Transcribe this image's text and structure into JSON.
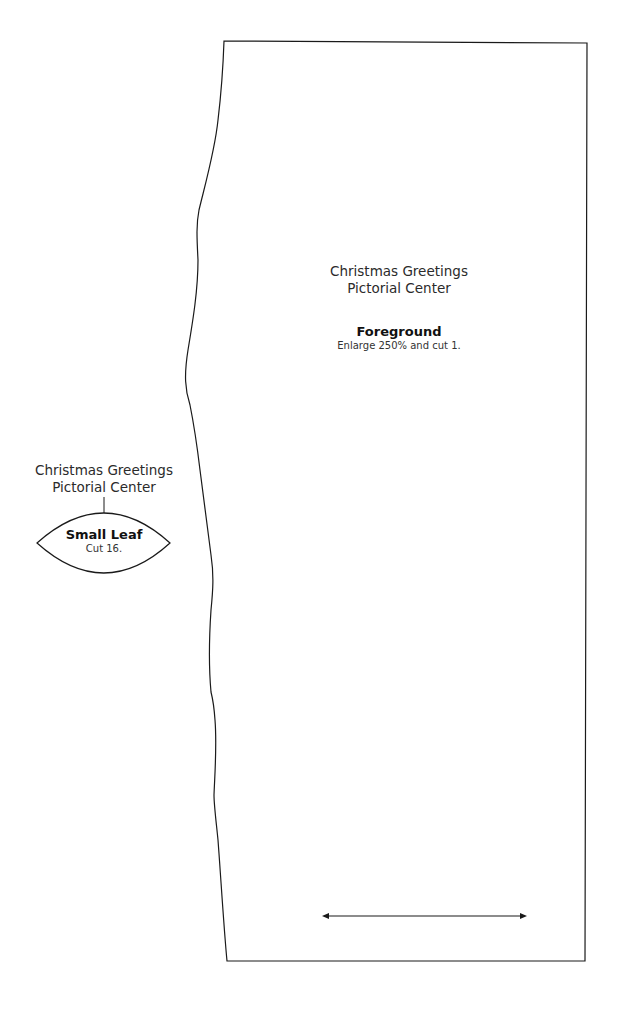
{
  "pattern": {
    "foreground": {
      "project_line1": "Christmas Greetings",
      "project_line2": "Pictorial Center",
      "piece_name": "Foreground",
      "instruction": "Enlarge 250% and cut 1."
    },
    "small_leaf": {
      "project_line1": "Christmas Greetings",
      "project_line2": "Pictorial Center",
      "piece_name": "Small Leaf",
      "instruction": "Cut 16."
    },
    "grain_arrow": "grainline-double-arrow",
    "colors": {
      "line": "#1a1a1a",
      "background": "#ffffff"
    }
  }
}
